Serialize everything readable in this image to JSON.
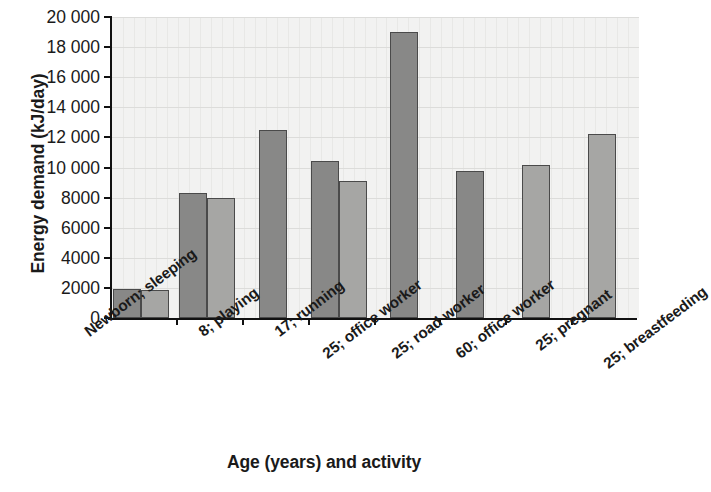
{
  "chart_data": {
    "type": "bar",
    "title": "",
    "xlabel": "Age (years) and activity",
    "ylabel": "Energy demand (kJ/day)",
    "ylim": [
      0,
      20000
    ],
    "ytick_step": 2000,
    "ytick_labels": [
      "20 000",
      "18 000",
      "16 000",
      "14 000",
      "12 000",
      "10 000",
      "8000",
      "6000",
      "4000",
      "2000",
      "0"
    ],
    "ytick_values": [
      20000,
      18000,
      16000,
      14000,
      12000,
      10000,
      8000,
      6000,
      4000,
      2000,
      0
    ],
    "grid": true,
    "legend": "none",
    "categories": [
      "Newborn; sleeping",
      "8; playing",
      "17; running",
      "25; office worker",
      "25; road worker",
      "60; office worker",
      "25; pregnant",
      "25; breastfeeding"
    ],
    "series": [
      {
        "name": "male",
        "color": "#888887",
        "values": [
          1900,
          8300,
          12500,
          10400,
          19000,
          9800,
          null,
          null
        ]
      },
      {
        "name": "female",
        "color": "#a6a6a4",
        "values": [
          1850,
          8000,
          null,
          9100,
          null,
          null,
          10200,
          12200
        ]
      }
    ],
    "bars": [
      {
        "category": "Newborn; sleeping",
        "series": "male",
        "value": 1900
      },
      {
        "category": "Newborn; sleeping",
        "series": "female",
        "value": 1850
      },
      {
        "category": "8; playing",
        "series": "male",
        "value": 8300
      },
      {
        "category": "8; playing",
        "series": "female",
        "value": 8000
      },
      {
        "category": "17; running",
        "series": "male",
        "value": 12500
      },
      {
        "category": "25; office worker",
        "series": "male",
        "value": 10400
      },
      {
        "category": "25; office worker",
        "series": "female",
        "value": 9100
      },
      {
        "category": "25; road worker",
        "series": "male",
        "value": 19000
      },
      {
        "category": "60; office worker",
        "series": "male",
        "value": 9800
      },
      {
        "category": "25; pregnant",
        "series": "female",
        "value": 10200
      },
      {
        "category": "25; breastfeeding",
        "series": "female",
        "value": 12200
      }
    ]
  },
  "axes": {
    "y_title": "Energy demand (kJ/day)",
    "x_title": "Age (years) and activity"
  }
}
